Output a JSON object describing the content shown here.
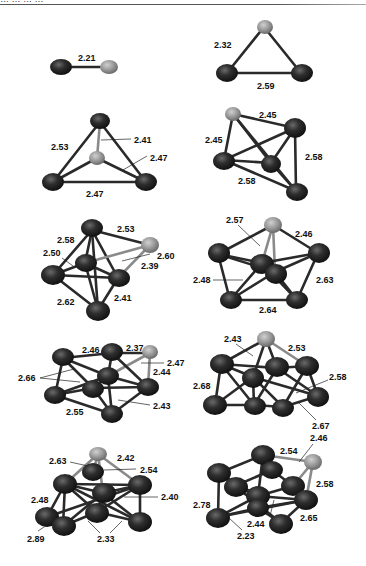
{
  "figure": {
    "header_fragment": "… … … …",
    "colors": {
      "metal_atom": "#2b2b2b",
      "dopant_atom": "#9a9a9a",
      "bond": "#2a2a2a",
      "label": "#111111"
    },
    "clusters": [
      {
        "id": "c2",
        "labels": [
          "2.21"
        ]
      },
      {
        "id": "c3",
        "labels": [
          "2.32",
          "2.59"
        ]
      },
      {
        "id": "c4",
        "labels": [
          "2.53",
          "2.41",
          "2.47",
          "2.47"
        ]
      },
      {
        "id": "c5",
        "labels": [
          "2.45",
          "2.45",
          "2.58",
          "2.58"
        ]
      },
      {
        "id": "c6",
        "labels": [
          "2.53",
          "2.58",
          "2.50",
          "2.60",
          "2.39",
          "2.62",
          "2.41"
        ]
      },
      {
        "id": "c7",
        "labels": [
          "2.57",
          "2.46",
          "2.48",
          "2.63",
          "2.64"
        ]
      },
      {
        "id": "c8",
        "labels": [
          "2.46",
          "2.37",
          "2.47",
          "2.66",
          "2.44",
          "2.43",
          "2.55"
        ]
      },
      {
        "id": "c9",
        "labels": [
          "2.43",
          "2.53",
          "2.68",
          "2.58",
          "2.67"
        ]
      },
      {
        "id": "c10",
        "labels": [
          "2.63",
          "2.42",
          "2.54",
          "2.48",
          "2.40",
          "2.89",
          "2.33"
        ]
      },
      {
        "id": "c11",
        "labels": [
          "2.46",
          "2.54",
          "2.58",
          "2.78",
          "2.65",
          "2.44",
          "2.23"
        ]
      }
    ]
  }
}
